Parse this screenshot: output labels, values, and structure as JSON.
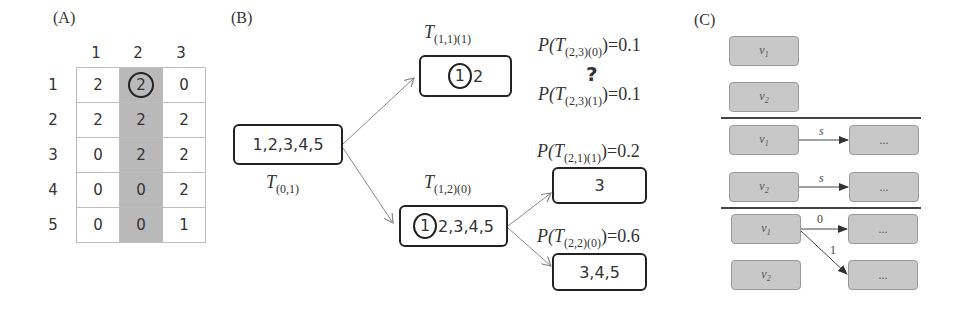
{
  "panel_a": {
    "label": "(A)",
    "col_headers": [
      "1",
      "2",
      "3"
    ],
    "row_headers": [
      "1",
      "2",
      "3",
      "4",
      "5"
    ],
    "rows": [
      [
        "2",
        "2",
        "0"
      ],
      [
        "2",
        "2",
        "2"
      ],
      [
        "0",
        "2",
        "2"
      ],
      [
        "0",
        "0",
        "2"
      ],
      [
        "0",
        "0",
        "1"
      ]
    ],
    "highlighted_column": "2",
    "circled_cell": {
      "row": "1",
      "col": "2",
      "value": "2"
    }
  },
  "panel_b": {
    "label": "(B)",
    "root": {
      "text": "1,2,3,4,5",
      "label_T": "T",
      "label_sub": "(0,1)"
    },
    "top_node": {
      "circled": "1",
      "rest": "2",
      "label_T": "T",
      "label_sub": "(1,1)(1)"
    },
    "mid_node": {
      "circled": "1",
      "rest": "2,3,4,5",
      "label_T": "T",
      "label_sub": "(1,2)(0)"
    },
    "leaf_a": {
      "text": "3",
      "prob_prefix": "P(",
      "prob_T": "T",
      "prob_sub": "(2,1)(1)",
      "prob_suffix": ")=0.2"
    },
    "leaf_b": {
      "text": "3,4,5",
      "prob_prefix": "P(",
      "prob_T": "T",
      "prob_sub": "(2,2)(0)",
      "prob_suffix": ")=0.6"
    },
    "unknown_1": {
      "prob_prefix": "P(",
      "prob_T": "T",
      "prob_sub": "(2,3)(0)",
      "prob_suffix": ")=0.1"
    },
    "question_mark": "?",
    "unknown_2": {
      "prob_prefix": "P(",
      "prob_T": "T",
      "prob_sub": "(2,3)(1)",
      "prob_suffix": ")=0.1"
    }
  },
  "panel_c": {
    "label": "(C)",
    "section1": {
      "nodes": [
        {
          "v": "v",
          "sub": "1"
        },
        {
          "v": "v",
          "sub": "2"
        }
      ]
    },
    "section2": {
      "nodes": [
        {
          "v": "v",
          "sub": "1"
        },
        {
          "v": "v",
          "sub": "2"
        }
      ],
      "edge_labels": [
        "s",
        "s"
      ],
      "targets": [
        "...",
        "..."
      ]
    },
    "section3": {
      "nodes": [
        {
          "v": "v",
          "sub": "1"
        },
        {
          "v": "v",
          "sub": "2"
        }
      ],
      "edge_labels": [
        "0",
        "1"
      ],
      "targets": [
        "...",
        "..."
      ]
    }
  },
  "colors": {
    "highlight": "#b9b9b9",
    "node_fill_c": "#c8c8c8",
    "stroke": "#222222",
    "arrow": "#888888"
  }
}
